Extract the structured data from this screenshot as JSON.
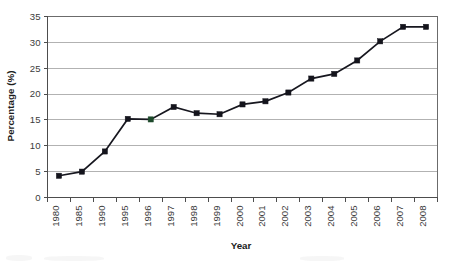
{
  "chart_data": {
    "type": "line",
    "title": "",
    "xlabel": "Year",
    "ylabel": "Percentage (%)",
    "categories": [
      "1980",
      "1985",
      "1990",
      "1995",
      "1996",
      "1997",
      "1998",
      "1999",
      "2000",
      "2001",
      "2002",
      "2003",
      "2004",
      "2005",
      "2006",
      "2007",
      "2008"
    ],
    "values": [
      4.2,
      5.0,
      8.9,
      15.2,
      15.1,
      17.5,
      16.3,
      16.1,
      18.0,
      18.6,
      20.3,
      23.0,
      23.9,
      26.5,
      30.2,
      33.0,
      33.0
    ],
    "series": [
      {
        "name": "Percentage",
        "values": [
          4.2,
          5.0,
          8.9,
          15.2,
          15.1,
          17.5,
          16.3,
          16.1,
          18.0,
          18.6,
          20.3,
          23.0,
          23.9,
          26.5,
          30.2,
          33.0,
          33.0
        ]
      }
    ],
    "ylim": [
      0,
      35
    ],
    "ytick_labels": [
      "0",
      "5",
      "10",
      "15",
      "20",
      "25",
      "30",
      "35"
    ],
    "ytick_values": [
      0,
      5,
      10,
      15,
      20,
      25,
      30,
      35
    ],
    "grid": "horizontal",
    "legend": "none",
    "marker": "square",
    "colors": {
      "line": "#17171f",
      "marker": "#14141c",
      "gridline": "#b2b2b2",
      "axis": "#4d4d4d",
      "text": "#3b3b3b",
      "background": "#ffffff"
    },
    "annotations": []
  }
}
